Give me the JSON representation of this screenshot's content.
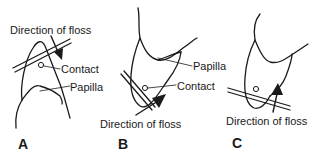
{
  "figure": {
    "panels": [
      {
        "id": "A",
        "letter": "A",
        "labels": {
          "direction": "Direction of floss",
          "contact": "Contact",
          "papilla": "Papilla"
        }
      },
      {
        "id": "B",
        "letter": "B",
        "labels": {
          "direction": "Direction of floss",
          "contact": "Contact",
          "papilla": "Papilla"
        }
      },
      {
        "id": "C",
        "letter": "C",
        "labels": {
          "direction": "Direction of floss"
        }
      }
    ],
    "colors": {
      "line": "#1a1a1a",
      "background": "#ffffff"
    }
  }
}
